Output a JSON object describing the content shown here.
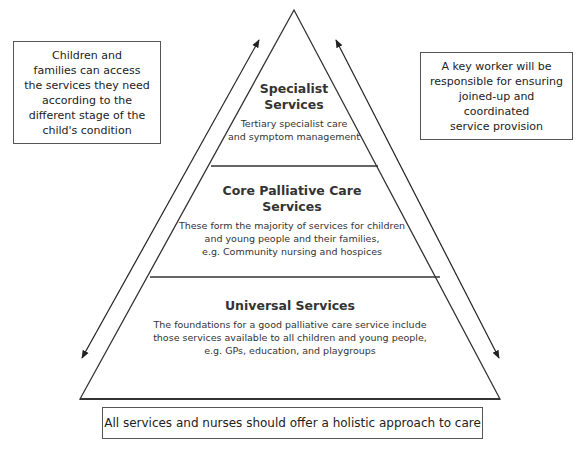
{
  "diagram": {
    "type": "pyramid",
    "tiers": [
      {
        "level": "top",
        "title_lines": [
          "Specialist",
          "Services"
        ],
        "description_lines": [
          "Tertiary specialist care",
          "and symptom management"
        ]
      },
      {
        "level": "middle",
        "title_lines": [
          "Core Palliative Care",
          "Services"
        ],
        "description_lines": [
          "These form the majority of services for children",
          "and young people and their families,",
          "e.g. Community nursing and hospices"
        ]
      },
      {
        "level": "base",
        "title_lines": [
          "Universal Services"
        ],
        "description_lines": [
          "The foundations for a good palliative care service include",
          "those services available to all children and young people,",
          "e.g. GPs, education, and playgroups"
        ]
      }
    ],
    "left_note": {
      "lines": [
        "Children and",
        "families can access",
        "the services they need",
        "according to the",
        "different stage of the",
        "child's condition"
      ]
    },
    "right_note": {
      "lines": [
        "A key worker will be",
        "responsible for ensuring",
        "joined-up and coordinated",
        "service provision"
      ]
    },
    "bottom_note": "All services and nurses should offer a holistic approach to care",
    "arrows": [
      {
        "side": "left",
        "direction": "bidirectional",
        "parallel_to": "pyramid-left-edge"
      },
      {
        "side": "right",
        "direction": "bidirectional",
        "parallel_to": "pyramid-right-edge"
      }
    ],
    "colors": {
      "line": "#333333",
      "text": "#222222",
      "background": "#ffffff"
    }
  }
}
